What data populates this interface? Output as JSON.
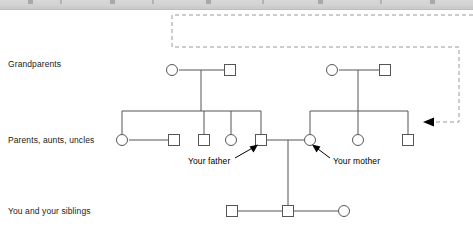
{
  "toolbar": {
    "visible": true,
    "truncated": true
  },
  "diagram": {
    "title": "",
    "background_color": "#ffffff",
    "line_color": "#555555",
    "symbol_stroke": "#555555",
    "dashed_color": "#999999",
    "arrow_color": "#000000",
    "row_labels": [
      {
        "id": "generation-1",
        "text": "Grandparents",
        "x": 8,
        "y": 64
      },
      {
        "id": "generation-2",
        "text": "Parents, aunts, uncles",
        "x": 8,
        "y": 133
      },
      {
        "id": "generation-3",
        "text": "You and your siblings",
        "x": 8,
        "y": 203
      }
    ],
    "callouts": [
      {
        "id": "father-callout",
        "text": "Your father",
        "x": 190,
        "y": 150
      },
      {
        "id": "mother-callout",
        "text": "Your mother",
        "x": 332,
        "y": 150
      }
    ],
    "symbols": {
      "female_shape": "circle",
      "male_shape": "square"
    },
    "generation_1": {
      "paternal_couple": [
        {
          "id": "paternal-grandmother",
          "sex": "female",
          "shape": "circle",
          "x": 172,
          "y": 70
        },
        {
          "id": "paternal-grandfather",
          "sex": "male",
          "shape": "square",
          "x": 230,
          "y": 70
        }
      ],
      "maternal_couple": [
        {
          "id": "maternal-grandmother",
          "sex": "female",
          "shape": "circle",
          "x": 332,
          "y": 70
        },
        {
          "id": "maternal-grandfather",
          "sex": "male",
          "shape": "square",
          "x": 385,
          "y": 70
        }
      ]
    },
    "generation_2": {
      "paternal_children": [
        {
          "id": "paternal-aunt-1",
          "sex": "female",
          "shape": "circle",
          "x": 122,
          "y": 140
        },
        {
          "id": "paternal-uncle-1",
          "sex": "male",
          "shape": "square",
          "x": 174,
          "y": 140
        },
        {
          "id": "paternal-uncle-2",
          "sex": "male",
          "shape": "square",
          "x": 204,
          "y": 140
        },
        {
          "id": "paternal-aunt-2",
          "sex": "female",
          "shape": "circle",
          "x": 231,
          "y": 140
        },
        {
          "id": "father",
          "sex": "male",
          "shape": "square",
          "x": 261,
          "y": 140,
          "label": "Your father"
        }
      ],
      "maternal_children": [
        {
          "id": "mother",
          "sex": "female",
          "shape": "circle",
          "x": 310,
          "y": 140,
          "label": "Your mother"
        },
        {
          "id": "maternal-aunt-1",
          "sex": "female",
          "shape": "circle",
          "x": 358,
          "y": 140
        },
        {
          "id": "maternal-uncle-1",
          "sex": "male",
          "shape": "square",
          "x": 408,
          "y": 140
        }
      ]
    },
    "generation_3": {
      "children": [
        {
          "id": "sibling-brother",
          "sex": "male",
          "shape": "square",
          "x": 232,
          "y": 211
        },
        {
          "id": "you",
          "sex": "male",
          "shape": "square",
          "x": 288,
          "y": 211
        },
        {
          "id": "sibling-sister",
          "sex": "female",
          "shape": "circle",
          "x": 344,
          "y": 211
        }
      ]
    },
    "dashed_pointer": {
      "id": "dashed-callout-line",
      "style": "dashed",
      "arrowhead": "left",
      "path": "M 473,15 L 172,15 L 172,47 L 459,47 L 459,122 L 432,122",
      "arrow_tip_x": 430,
      "arrow_tip_y": 122
    }
  }
}
